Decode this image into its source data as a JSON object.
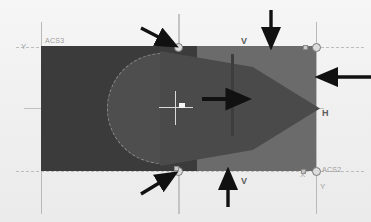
{
  "app": {
    "title": "CAD Model Viewport"
  },
  "viewport": {
    "width": 371,
    "height": 222,
    "background_color": "#f2f2f2"
  },
  "colors": {
    "face_dark": "#3b3b3b",
    "face_light": "#6b6b6b",
    "circle_fill": "#4e4e4e",
    "cone_fill": "#4a4a4a",
    "seam": "#3d3d3d",
    "construction_line": "#b9b9b9",
    "axis_line": "#9a9a9a",
    "grip_fill": "#dcdcdc",
    "grip_stroke": "#7a7a7a",
    "annotation_arrow": "#111111",
    "label_text": "#9c9c9c",
    "dimension_text": "#5d5d5d"
  },
  "ucs_markers": [
    {
      "id": "ucs-acs3",
      "label": "ACS3",
      "axis_label": "Y",
      "position": "top-left"
    },
    {
      "id": "ucs-acs2",
      "label": "ACS2",
      "axis_label_x": "X",
      "axis_label_y": "Y",
      "position": "bottom-right"
    }
  ],
  "labels": {
    "ucs_top_left": "ACS3",
    "ucs_bottom_right": "ACS2",
    "axis_y_left": "Y",
    "axis_x_bottom_right": "X",
    "axis_y_bottom_right": "Y",
    "dim_horizontal": "H",
    "dim_vertical_top": "V",
    "dim_vertical_bottom": "V"
  },
  "geometry": {
    "rectangle": {
      "name": "extruded-block",
      "fill_dark": "#3b3b3b",
      "fill_light": "#6b6b6b"
    },
    "circle": {
      "name": "cylinder-profile",
      "fill": "#4e4e4e",
      "edge_style": "dashed"
    },
    "cone": {
      "name": "cone-solid",
      "fill": "#4a4a4a",
      "apex": "right"
    },
    "seam": {
      "name": "vertical-seam-edge",
      "fill": "#3d3d3d"
    }
  },
  "grips": [
    {
      "id": "grip-top-center",
      "type": "circle",
      "x": 178,
      "y": 47
    },
    {
      "id": "grip-bottom-center",
      "type": "circle",
      "x": 178,
      "y": 171
    },
    {
      "id": "grip-top-right",
      "type": "circle",
      "x": 316,
      "y": 47
    },
    {
      "id": "grip-bottom-right",
      "type": "circle",
      "x": 316,
      "y": 171
    },
    {
      "id": "grip-square-bottom-left",
      "type": "square",
      "x": 176,
      "y": 168
    },
    {
      "id": "grip-square-bottom-right",
      "type": "square",
      "x": 303,
      "y": 171
    },
    {
      "id": "grip-square-top-right",
      "type": "square",
      "x": 316,
      "y": 47
    }
  ],
  "annotations": [
    {
      "id": "arrow-top-left-diagonal",
      "direction": "down-right",
      "target": "grip-top-center"
    },
    {
      "id": "arrow-top-right-down",
      "direction": "down",
      "target": "top-edge"
    },
    {
      "id": "arrow-center-right",
      "direction": "right",
      "target": "cone-solid"
    },
    {
      "id": "arrow-right-left",
      "direction": "left",
      "target": "right-edge"
    },
    {
      "id": "arrow-bottom-left-diagonal",
      "direction": "up-right",
      "target": "grip-bottom-center"
    },
    {
      "id": "arrow-bottom-up",
      "direction": "up",
      "target": "bottom-edge"
    }
  ],
  "cursor": {
    "name": "crosshair-cursor",
    "x": 176,
    "y": 108
  }
}
